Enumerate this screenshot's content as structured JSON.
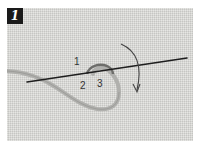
{
  "figure": {
    "step_number": "1",
    "labels": {
      "point1": "1",
      "point2": "2",
      "point3": "3"
    },
    "colors": {
      "fabric": "#d9d9d6",
      "needle": "#1e1e1e",
      "thread": "#a8a8a5",
      "badge": "#1a1a1a",
      "arrow": "#444444"
    }
  }
}
